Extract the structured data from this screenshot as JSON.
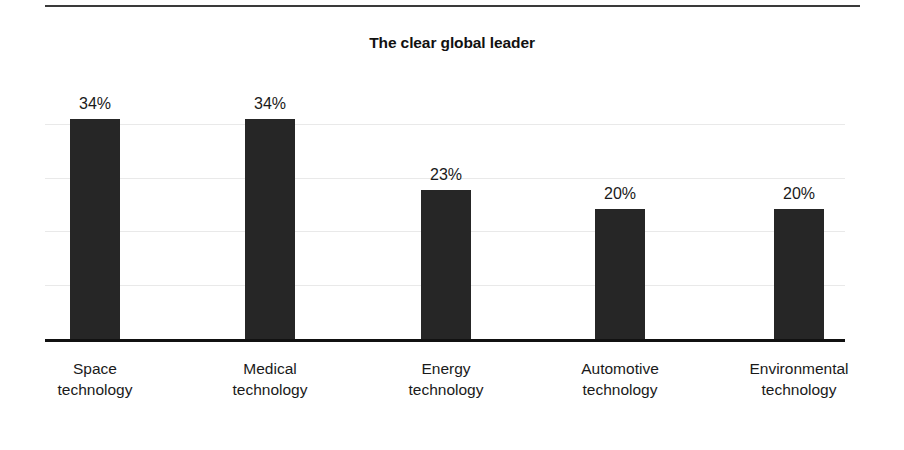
{
  "page": {
    "background_color": "#ffffff",
    "width": 904,
    "height": 450
  },
  "top_rule": {
    "color": "#3a3a3a"
  },
  "chart_data": {
    "type": "bar",
    "title": "The clear global leader",
    "subtitle": "",
    "xlabel": "",
    "ylabel": "",
    "categories": [
      "Space technology",
      "Medical technology",
      "Energy technology",
      "Automotive technology",
      "Environmental technology"
    ],
    "category_lines": [
      {
        "line1": "Space",
        "line2": "technology"
      },
      {
        "line1": "Medical",
        "line2": "technology"
      },
      {
        "line1": "Energy",
        "line2": "technology"
      },
      {
        "line1": "Automotive",
        "line2": "technology"
      },
      {
        "line1": "Environmental",
        "line2": "technology"
      }
    ],
    "values": [
      34,
      34,
      23,
      20,
      20
    ],
    "value_labels": [
      "34%",
      "34%",
      "23%",
      "20%",
      "20%"
    ],
    "unit": "%",
    "ylim": [
      0,
      41.5
    ],
    "gridlines": [
      8.3,
      16.6,
      24.9,
      33.2
    ],
    "grid": true,
    "grid_color": "#e9e9e9",
    "axis_color": "#111111",
    "bar_color": "#262626",
    "legend": null,
    "legend_position": "none",
    "bar_width_px": 50,
    "bar_centers_px": [
      50,
      225,
      401,
      575,
      754
    ]
  }
}
